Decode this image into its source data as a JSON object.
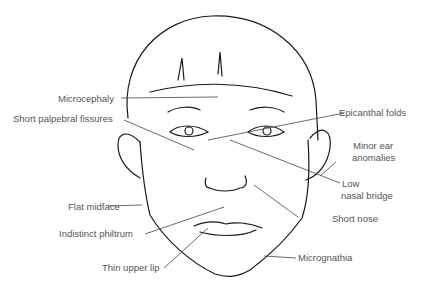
{
  "diagram": {
    "labels": {
      "microcephaly": "Microcephaly",
      "short_palpebral_fissures": "Short palpebral fissures",
      "epicanthal_folds": "Epicanthal folds",
      "minor_ear_anomalies_1": "Minor ear",
      "minor_ear_anomalies_2": "anomalies",
      "low_nasal_bridge_1": "Low",
      "low_nasal_bridge_2": "nasal bridge",
      "flat_midface": "Flat midface",
      "short_nose": "Short nose",
      "indistinct_philtrum": "Indistinct philtrum",
      "thin_upper_lip": "Thin upper lip",
      "micrognathia": "Micrognathia"
    },
    "colors": {
      "line": "#1a1a1a",
      "label_text": "#555555",
      "leader": "#444444",
      "background": "#ffffff"
    }
  }
}
